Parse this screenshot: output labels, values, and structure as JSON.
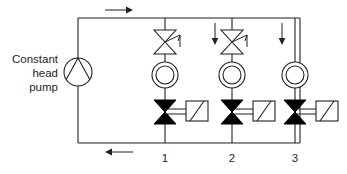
{
  "diagram": {
    "type": "hydronic-piping-schematic",
    "title_text": "",
    "stroke_color": "#231f20",
    "fill_color": "#000000",
    "background": "#ffffff",
    "pump": {
      "label_lines": [
        "Constant",
        "head",
        "pump"
      ],
      "symbol": "centrifugal-pump-circle",
      "cx": 78,
      "cy": 72,
      "r": 14
    },
    "circuit": {
      "left": 78,
      "right": 300,
      "top": 18,
      "bottom": 143
    },
    "flow_arrows": [
      {
        "name": "supply-flow-arrow",
        "direction": "right",
        "x": 110,
        "y": 10
      },
      {
        "name": "return-flow-arrow",
        "direction": "left",
        "x": 110,
        "y": 152
      },
      {
        "name": "branch2-flow-arrow",
        "direction": "down",
        "x": 215,
        "y": 28
      },
      {
        "name": "branch3-flow-arrow",
        "direction": "down",
        "x": 288,
        "y": 28
      }
    ],
    "branches": [
      {
        "id": "1",
        "label": "1",
        "x": 165,
        "has_regulating_valve": true,
        "regulating_valve": {
          "name": "globe-valve",
          "cy": 42
        },
        "coil": {
          "name": "coil-symbol",
          "cy": 75,
          "r_outer": 13,
          "r_inner": 9
        },
        "control_valve": {
          "name": "two-way-control-valve",
          "cy": 112
        },
        "actuator": {
          "name": "valve-actuator-box",
          "x": 186,
          "y": 101,
          "w": 22,
          "h": 20
        }
      },
      {
        "id": "2",
        "label": "2",
        "x": 232,
        "has_regulating_valve": true,
        "regulating_valve": {
          "name": "globe-valve",
          "cy": 42
        },
        "coil": {
          "name": "coil-symbol",
          "cy": 75,
          "r_outer": 13,
          "r_inner": 9
        },
        "control_valve": {
          "name": "two-way-control-valve",
          "cy": 112
        },
        "actuator": {
          "name": "valve-actuator-box",
          "x": 253,
          "y": 101,
          "w": 22,
          "h": 20
        }
      },
      {
        "id": "3",
        "label": "3",
        "x": 295,
        "has_regulating_valve": false,
        "regulating_valve": null,
        "coil": {
          "name": "coil-symbol",
          "cy": 75,
          "r_outer": 13,
          "r_inner": 9
        },
        "control_valve": {
          "name": "two-way-control-valve",
          "cy": 112
        },
        "actuator": {
          "name": "valve-actuator-box",
          "x": 316,
          "y": 101,
          "w": 22,
          "h": 20
        }
      }
    ],
    "branch_number_labels": {
      "y": 158,
      "items": [
        {
          "text": "1",
          "x": 165
        },
        {
          "text": "2",
          "x": 232
        },
        {
          "text": "3",
          "x": 295
        }
      ]
    }
  }
}
